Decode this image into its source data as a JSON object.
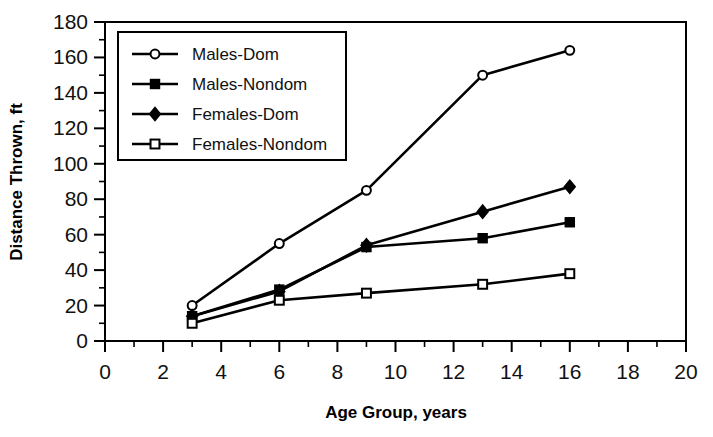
{
  "chart_data": {
    "type": "line",
    "title": "",
    "xlabel": "Age Group, years",
    "ylabel": "Distance Thrown, ft",
    "xlim": [
      0,
      20
    ],
    "ylim": [
      0,
      180
    ],
    "xticks": [
      0,
      2,
      4,
      6,
      8,
      10,
      12,
      14,
      16,
      18,
      20
    ],
    "yticks": [
      0,
      20,
      40,
      60,
      80,
      100,
      120,
      140,
      160,
      180
    ],
    "xtick_labels": [
      "0",
      "2",
      "4",
      "6",
      "8",
      "10",
      "12",
      "14",
      "16",
      "18",
      "20"
    ],
    "ytick_labels": [
      "0",
      "20",
      "40",
      "60",
      "80",
      "100",
      "120",
      "140",
      "160",
      "180"
    ],
    "x_minor_step": 1,
    "y_minor_step": 10,
    "grid": false,
    "legend_position": "upper left inside",
    "x": [
      3,
      6,
      9,
      13,
      16
    ],
    "series": [
      {
        "name": "Males-Dom",
        "marker": "open-circle",
        "color": "#000000",
        "values": [
          20,
          55,
          85,
          150,
          164
        ]
      },
      {
        "name": "Males-Nondom",
        "marker": "filled-square",
        "color": "#000000",
        "values": [
          14,
          29,
          53,
          58,
          67
        ]
      },
      {
        "name": "Females-Dom",
        "marker": "filled-diamond",
        "color": "#000000",
        "values": [
          14,
          28,
          54,
          73,
          87
        ]
      },
      {
        "name": "Females-Nondom",
        "marker": "open-square",
        "color": "#000000",
        "values": [
          10,
          23,
          27,
          32,
          38
        ]
      }
    ]
  }
}
